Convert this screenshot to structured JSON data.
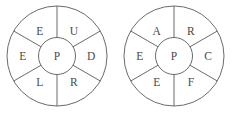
{
  "figure": {
    "type": "word-wheel-pair",
    "background_color": "#ffffff",
    "stroke_color": "#6b6b6b",
    "text_color": "#4a4a4a",
    "wheels": [
      {
        "id": "left-wheel",
        "center_x": 57,
        "center_y": 56,
        "outer_radius": 50,
        "hub_radius": 18.5,
        "hub_letter": "P",
        "sector_count": 6,
        "spoke_angles_deg": [
          90,
          150,
          210,
          270,
          330,
          30
        ],
        "sectors": [
          {
            "position": "top-left",
            "letter": "E",
            "angle_deg": 120
          },
          {
            "position": "top-right",
            "letter": "U",
            "angle_deg": 60
          },
          {
            "position": "right",
            "letter": "D",
            "angle_deg": 0
          },
          {
            "position": "bottom-right",
            "letter": "R",
            "angle_deg": 300
          },
          {
            "position": "bottom-left",
            "letter": "L",
            "angle_deg": 240
          },
          {
            "position": "left",
            "letter": "E",
            "angle_deg": 180
          }
        ]
      },
      {
        "id": "right-wheel",
        "center_x": 174,
        "center_y": 56,
        "outer_radius": 50,
        "hub_radius": 18.5,
        "hub_letter": "P",
        "sector_count": 6,
        "spoke_angles_deg": [
          90,
          150,
          210,
          270,
          330,
          30
        ],
        "sectors": [
          {
            "position": "top-left",
            "letter": "A",
            "angle_deg": 120
          },
          {
            "position": "top-right",
            "letter": "R",
            "angle_deg": 60
          },
          {
            "position": "right",
            "letter": "C",
            "angle_deg": 0
          },
          {
            "position": "bottom-right",
            "letter": "F",
            "angle_deg": 300
          },
          {
            "position": "bottom-left",
            "letter": "E",
            "angle_deg": 240
          },
          {
            "position": "left",
            "letter": "E",
            "angle_deg": 180
          }
        ]
      }
    ]
  }
}
